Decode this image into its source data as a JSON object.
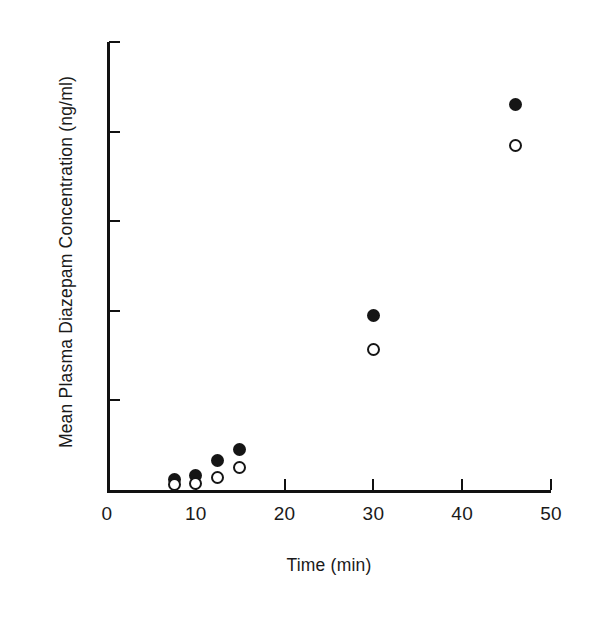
{
  "chart_data": {
    "type": "scatter",
    "title": "",
    "xlabel": "Time (min)",
    "ylabel": "Mean Plasma Diazepam Concentration  (ng/ml)",
    "xlim": [
      0,
      50
    ],
    "ylim": [
      0,
      500
    ],
    "xticks": [
      0,
      10,
      20,
      30,
      40,
      50
    ],
    "yticks": [
      0,
      100,
      200,
      300,
      400,
      500
    ],
    "xtick_labels": [
      "0",
      "10",
      "20",
      "30",
      "40",
      "50"
    ],
    "ytick_labels": [
      "",
      "100",
      "200",
      "300",
      "400",
      "500"
    ],
    "grid": false,
    "legend": "none",
    "series": [
      {
        "name": "filled-circle-series",
        "marker": "filled-circle",
        "color": "#151515",
        "points": [
          {
            "x": 7.6,
            "y": 12
          },
          {
            "x": 10.0,
            "y": 16
          },
          {
            "x": 12.4,
            "y": 33
          },
          {
            "x": 14.9,
            "y": 45
          },
          {
            "x": 30.0,
            "y": 195
          },
          {
            "x": 46.0,
            "y": 430
          }
        ]
      },
      {
        "name": "open-circle-series",
        "marker": "open-circle",
        "color": "#151515",
        "points": [
          {
            "x": 7.6,
            "y": 6
          },
          {
            "x": 10.0,
            "y": 7
          },
          {
            "x": 12.4,
            "y": 14
          },
          {
            "x": 14.9,
            "y": 25
          },
          {
            "x": 30.0,
            "y": 157
          },
          {
            "x": 46.0,
            "y": 385
          }
        ]
      }
    ]
  },
  "axis": {
    "x_tick_marks": [
      0,
      10,
      20,
      30,
      40,
      50
    ],
    "y_tick_marks": [
      100,
      200,
      300,
      400,
      500
    ]
  }
}
